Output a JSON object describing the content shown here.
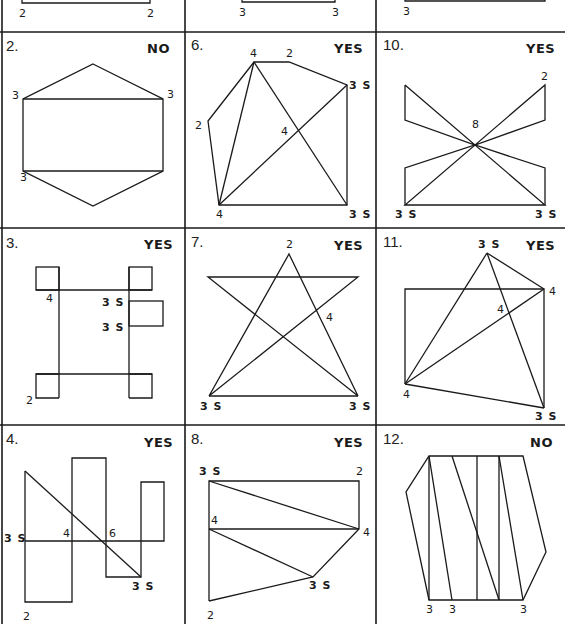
{
  "page": {
    "colors": {
      "ink": "#1a1a1a",
      "paper": "#ffffff"
    }
  },
  "top_row": {
    "cell_1": {
      "labels": [
        "2",
        "2"
      ]
    },
    "cell_5": {
      "labels": [
        "3",
        "3"
      ]
    },
    "cell_9": {
      "labels": [
        "3"
      ]
    }
  },
  "cells": {
    "c2": {
      "number": "2.",
      "answer": "NO",
      "vertices": [
        "3",
        "3",
        "3"
      ]
    },
    "c6": {
      "number": "6.",
      "answer": "YES",
      "vertices": [
        "4",
        "2",
        "3 S",
        "2",
        "4",
        "4",
        "3 S"
      ]
    },
    "c10": {
      "number": "10.",
      "answer": "YES",
      "vertices": [
        "2",
        "8",
        "3 S",
        "3 S"
      ]
    },
    "c3": {
      "number": "3.",
      "answer": "YES",
      "vertices": [
        "4",
        "3 S",
        "3 S",
        "2"
      ]
    },
    "c7": {
      "number": "7.",
      "answer": "YES",
      "vertices": [
        "2",
        "4",
        "3 S",
        "3 S"
      ]
    },
    "c11": {
      "number": "11.",
      "answer": "YES",
      "vertices": [
        "3 S",
        "4",
        "4",
        "4",
        "3 S"
      ]
    },
    "c4": {
      "number": "4.",
      "answer": "YES",
      "vertices": [
        "3 S",
        "4",
        "6",
        "3 S",
        "2"
      ]
    },
    "c8": {
      "number": "8.",
      "answer": "YES",
      "vertices": [
        "3 S",
        "2",
        "4",
        "4",
        "3 S",
        "2"
      ]
    },
    "c12": {
      "number": "12.",
      "answer": "NO",
      "vertices": [
        "3",
        "3",
        "3"
      ]
    }
  }
}
